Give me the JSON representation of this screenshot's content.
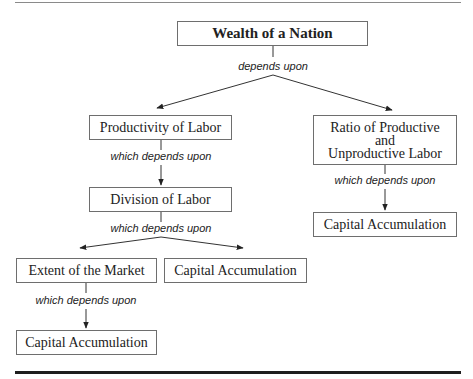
{
  "diagram": {
    "title": "Wealth of a Nation",
    "nodes": [
      {
        "id": "wealth",
        "label": "Wealth of a Nation"
      },
      {
        "id": "productivity",
        "label": "Productivity of Labor"
      },
      {
        "id": "ratio",
        "label": "Ratio of Productive\nand\nUnproductive Labor"
      },
      {
        "id": "division",
        "label": "Division of Labor"
      },
      {
        "id": "capital_right",
        "label": "Capital Accumulation"
      },
      {
        "id": "extent",
        "label": "Extent of the Market"
      },
      {
        "id": "capital_mid",
        "label": "Capital Accumulation"
      },
      {
        "id": "capital_bottom",
        "label": "Capital Accumulation"
      }
    ],
    "edge_labels": {
      "wealth": "depends upon",
      "productivity": "which depends upon",
      "ratio": "which depends upon",
      "division": "which depends upon",
      "extent": "which depends upon"
    },
    "edges": [
      {
        "from": "wealth",
        "to": "productivity"
      },
      {
        "from": "wealth",
        "to": "ratio"
      },
      {
        "from": "productivity",
        "to": "division"
      },
      {
        "from": "ratio",
        "to": "capital_right"
      },
      {
        "from": "division",
        "to": "extent"
      },
      {
        "from": "division",
        "to": "capital_mid"
      },
      {
        "from": "extent",
        "to": "capital_bottom"
      }
    ],
    "colors": {
      "border": "#6e6e6e",
      "line": "#333333",
      "text": "#222222"
    }
  }
}
